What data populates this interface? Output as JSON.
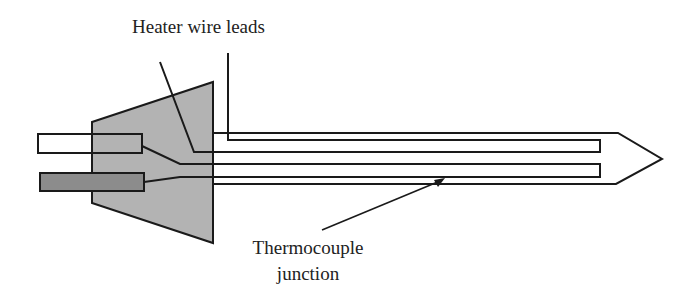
{
  "diagram": {
    "labels": {
      "heater_leads": "Heater wire leads",
      "thermocouple_line1": "Thermocouple",
      "thermocouple_line2": "junction"
    },
    "colors": {
      "stroke": "#1a1a1a",
      "housing_fill": "#b3b3b3",
      "connector_light_fill": "#ffffff",
      "connector_dark_fill": "#8c8c8c",
      "text": "#222222",
      "background": "#ffffff"
    },
    "components": [
      {
        "id": "housing",
        "shape": "trapezoid"
      },
      {
        "id": "connector-light",
        "shape": "rectangle"
      },
      {
        "id": "connector-dark",
        "shape": "rectangle"
      },
      {
        "id": "probe-sheath",
        "shape": "pointed-tube"
      },
      {
        "id": "heater-loop",
        "shape": "u-loop"
      },
      {
        "id": "thermocouple-loop",
        "shape": "u-loop"
      }
    ]
  }
}
